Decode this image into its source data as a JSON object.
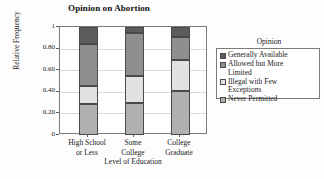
{
  "chart_data": {
    "type": "bar",
    "subtype": "stacked-bar-100",
    "title": "Opinion on Abortion",
    "xlabel": "Level of Education",
    "ylabel": "Relative Frequency",
    "categories": [
      "High School\nor Less",
      "Some\nCollege",
      "College\nGraduate"
    ],
    "category_labels_flat": [
      "High School or Less",
      "Some College",
      "College Graduate"
    ],
    "ylim": [
      0,
      1
    ],
    "ytick_labels": [
      "1",
      "0.80",
      "0.60",
      "0.40",
      "0.20",
      "0"
    ],
    "ytick_values": [
      1,
      0.8,
      0.6,
      0.4,
      0.2,
      0
    ],
    "grid": true,
    "legend_position": "right",
    "legend_title": "Opinion",
    "stack_order_bottom_to_top": [
      "Never Permitted",
      "Illegal with Few Exceptions",
      "Allowed but More Limited",
      "Generally Available"
    ],
    "series": [
      {
        "name": "Generally Available",
        "legend_label": "Generally Available",
        "color": "#5c5c5c",
        "values": [
          0.16,
          0.06,
          0.09
        ],
        "cumulative_top": [
          1.0,
          1.0,
          1.0
        ],
        "cumulative_bottom": [
          0.84,
          0.94,
          0.91
        ]
      },
      {
        "name": "Allowed but More Limited",
        "legend_label": "Allowed but More\nLimited",
        "color": "#8f8f8f",
        "values": [
          0.39,
          0.395,
          0.22
        ],
        "cumulative_top": [
          0.84,
          0.94,
          0.91
        ],
        "cumulative_bottom": [
          0.45,
          0.545,
          0.69
        ]
      },
      {
        "name": "Illegal with Few Exceptions",
        "legend_label": "Illegal with Few\nExceptions",
        "color": "#e2e2e2",
        "values": [
          0.165,
          0.245,
          0.28
        ],
        "cumulative_top": [
          0.45,
          0.545,
          0.69
        ],
        "cumulative_bottom": [
          0.285,
          0.3,
          0.41
        ]
      },
      {
        "name": "Never Permitted",
        "legend_label": "Never Permitted",
        "color": "#b0b0b0",
        "values": [
          0.285,
          0.3,
          0.41
        ],
        "cumulative_top": [
          0.285,
          0.3,
          0.41
        ],
        "cumulative_bottom": [
          0,
          0,
          0
        ]
      }
    ]
  }
}
